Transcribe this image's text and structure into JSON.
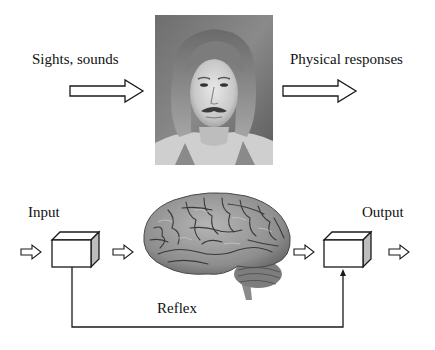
{
  "top_section": {
    "input_label": "Sights, sounds",
    "output_label": "Physical responses",
    "photo": {
      "description": "black-and-white portrait of a man with shoulder-length hair and mustache"
    }
  },
  "bottom_section": {
    "input_label": "Input",
    "output_label": "Output",
    "brain": {
      "description": "grayscale lateral view of a human brain"
    },
    "reflex_label": "Reflex"
  },
  "colors": {
    "line": "#1a1a1a",
    "box_side": "#bdbdbd",
    "background": "#ffffff"
  }
}
